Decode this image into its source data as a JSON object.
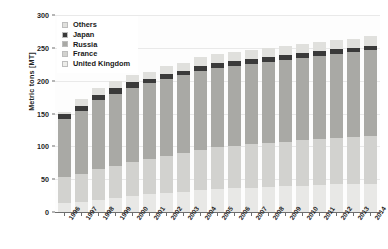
{
  "chart_data": {
    "type": "bar",
    "stacked": true,
    "title": "",
    "xlabel": "",
    "ylabel": "Metric tons [MT]",
    "ylim": [
      0,
      300
    ],
    "yticks": [
      0,
      50,
      100,
      150,
      200,
      250,
      300
    ],
    "grid": true,
    "legend_position": "top-left",
    "categories": [
      "1996",
      "1997",
      "1998",
      "1999",
      "2000",
      "2001",
      "2002",
      "2003",
      "2004",
      "2005",
      "2006",
      "2007",
      "2008",
      "2009",
      "2010",
      "2011",
      "2012",
      "2013",
      "2014"
    ],
    "series": [
      {
        "name": "United Kingdom",
        "color": "#e8e8e6",
        "values": [
          14,
          16,
          19,
          22,
          25,
          27,
          29,
          31,
          33,
          35,
          36,
          37,
          38,
          39,
          40,
          41,
          42,
          42,
          43
        ]
      },
      {
        "name": "France",
        "color": "#d2d2cf",
        "values": [
          40,
          42,
          46,
          48,
          51,
          54,
          57,
          59,
          62,
          64,
          65,
          66,
          67,
          68,
          69,
          70,
          71,
          72,
          73
        ]
      },
      {
        "name": "Russia",
        "color": "#a9a9a5",
        "values": [
          88,
          96,
          105,
          110,
          113,
          115,
          117,
          118,
          120,
          121,
          122,
          123,
          124,
          125,
          126,
          127,
          128,
          129,
          130
        ]
      },
      {
        "name": "Japan",
        "color": "#3a3a3a",
        "values": [
          7,
          8,
          8,
          9,
          9,
          6,
          7,
          7,
          7,
          7,
          7,
          7,
          7,
          7,
          7,
          7,
          7,
          7,
          7
        ]
      },
      {
        "name": "Others",
        "color": "#e0e0dd",
        "values": [
          3,
          10,
          11,
          11,
          10,
          11,
          13,
          12,
          14,
          14,
          14,
          14,
          14,
          14,
          14,
          14,
          14,
          14,
          15
        ]
      }
    ],
    "totals": [
      152,
      172,
      189,
      200,
      208,
      213,
      223,
      227,
      236,
      241,
      244,
      247,
      250,
      253,
      256,
      259,
      262,
      264,
      268
    ],
    "legend_entries": [
      {
        "label": "Others",
        "color": "#e0e0dd"
      },
      {
        "label": "Japan",
        "color": "#3a3a3a"
      },
      {
        "label": "Russia",
        "color": "#a9a9a5"
      },
      {
        "label": "France",
        "color": "#d2d2cf"
      },
      {
        "label": "United Kingdom",
        "color": "#ededea"
      }
    ]
  }
}
